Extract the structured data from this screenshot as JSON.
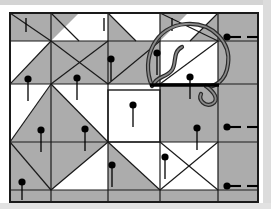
{
  "figure": {
    "kind": "quilting-instruction-diagram",
    "title": "Pieced quilt top with pinned basting and threaded needle",
    "canvas": {
      "width": 271,
      "height": 209
    },
    "background_color": "#ffffff"
  },
  "palette": {
    "patch_light": "#ffffff",
    "patch_gray": "#acacac",
    "seam_line": "#1a1a1a",
    "pin_color": "#000000",
    "thread_outline": "#2b2b2b",
    "thread_fill": "#8a8a8a",
    "needle_color": "#000000",
    "border_color": "#1a1a1a",
    "page_edge": "#c9c9c9"
  },
  "quilt": {
    "frame": {
      "x": 10,
      "y": 13,
      "width": 248,
      "height": 189,
      "stroke_width": 2
    },
    "grid_lines": [
      {
        "name": "vertical-seam-left",
        "x1": 51,
        "y1": 13,
        "x2": 51,
        "y2": 202
      },
      {
        "name": "vertical-seam-center",
        "x1": 108,
        "y1": 13,
        "x2": 108,
        "y2": 202
      },
      {
        "name": "vertical-seam-right-of-center",
        "x1": 160,
        "y1": 13,
        "x2": 160,
        "y2": 202
      },
      {
        "name": "vertical-seam-right",
        "x1": 218,
        "y1": 13,
        "x2": 218,
        "y2": 202
      },
      {
        "name": "horizontal-seam-top",
        "x1": 10,
        "y1": 41,
        "x2": 258,
        "y2": 41
      },
      {
        "name": "horizontal-seam-upper",
        "x1": 10,
        "y1": 84,
        "x2": 258,
        "y2": 84
      },
      {
        "name": "horizontal-seam-lower",
        "x1": 10,
        "y1": 142,
        "x2": 258,
        "y2": 142
      },
      {
        "name": "horizontal-seam-bottom",
        "x1": 10,
        "y1": 190,
        "x2": 258,
        "y2": 190
      }
    ],
    "gray_patches": [
      {
        "name": "top-strip-left-rect",
        "points": "10,13 51,13 51,41 10,41"
      },
      {
        "name": "top-strip-triangle-a",
        "points": "51,41 51,13 79,13"
      },
      {
        "name": "top-strip-triangle-b",
        "points": "108,13 136,41 108,41"
      },
      {
        "name": "top-strip-triangle-c",
        "points": "160,13 188,13 160,41"
      },
      {
        "name": "top-strip-triangle-d",
        "points": "190,41 218,13 218,41"
      },
      {
        "name": "pinwheel-blade-upper-left",
        "points": "51,41 108,41 108,84 51,84"
      },
      {
        "name": "pinwheel-blade-lower-left",
        "points": "10,84 51,41 51,84"
      },
      {
        "name": "pinwheel-sash-diagonal",
        "points": "108,41 160,41 160,84 108,84"
      },
      {
        "name": "right-column-upper",
        "points": "218,13 258,13 258,84 218,84"
      },
      {
        "name": "right-column-lower",
        "points": "218,84 258,84 258,190 218,190"
      },
      {
        "name": "mid-left-diamond",
        "points": "10,142 51,84 108,142 51,190"
      },
      {
        "name": "center-ring-upper-right",
        "points": "160,84 218,84 218,142 160,142"
      },
      {
        "name": "lower-left-wedge",
        "points": "10,190 10,142 51,190"
      },
      {
        "name": "lower-center-wedge",
        "points": "108,142 160,190 108,190"
      },
      {
        "name": "bottom-band-gray",
        "points": "10,190 258,190 258,202 10,202"
      }
    ],
    "diagonal_seams": [
      {
        "name": "diag-top-left-down",
        "x1": 51,
        "y1": 13,
        "x2": 79,
        "y2": 41
      },
      {
        "name": "diag-pinwheel-nw",
        "x1": 10,
        "y1": 13,
        "x2": 51,
        "y2": 41
      },
      {
        "name": "diag-pinwheel-center-a",
        "x1": 51,
        "y1": 41,
        "x2": 108,
        "y2": 84
      },
      {
        "name": "diag-pinwheel-center-b",
        "x1": 108,
        "y1": 41,
        "x2": 51,
        "y2": 84
      },
      {
        "name": "diag-pinwheel-left",
        "x1": 10,
        "y1": 84,
        "x2": 51,
        "y2": 41
      },
      {
        "name": "diag-sash-upper",
        "x1": 108,
        "y1": 84,
        "x2": 160,
        "y2": 41
      },
      {
        "name": "diag-sash-upper-2",
        "x1": 136,
        "y1": 41,
        "x2": 108,
        "y2": 13
      },
      {
        "name": "diag-upper-right-a",
        "x1": 160,
        "y1": 13,
        "x2": 218,
        "y2": 41
      },
      {
        "name": "diag-upper-right-b",
        "x1": 160,
        "y1": 84,
        "x2": 218,
        "y2": 41
      },
      {
        "name": "diag-upper-right-c",
        "x1": 190,
        "y1": 41,
        "x2": 218,
        "y2": 13
      },
      {
        "name": "diag-mid-left-a",
        "x1": 10,
        "y1": 142,
        "x2": 51,
        "y2": 84
      },
      {
        "name": "diag-mid-left-b",
        "x1": 51,
        "y1": 84,
        "x2": 108,
        "y2": 142
      },
      {
        "name": "diag-mid-left-c",
        "x1": 10,
        "y1": 142,
        "x2": 51,
        "y2": 190
      },
      {
        "name": "diag-mid-left-d",
        "x1": 51,
        "y1": 190,
        "x2": 108,
        "y2": 142
      },
      {
        "name": "diag-lower-center",
        "x1": 108,
        "y1": 142,
        "x2": 160,
        "y2": 190
      },
      {
        "name": "diag-lower-right-a",
        "x1": 160,
        "y1": 142,
        "x2": 218,
        "y2": 190
      },
      {
        "name": "diag-lower-right-b",
        "x1": 160,
        "y1": 190,
        "x2": 218,
        "y2": 142
      }
    ],
    "center_square": {
      "x": 108,
      "y": 90,
      "width": 52,
      "height": 52,
      "fill": "#ffffff"
    }
  },
  "pins": {
    "description": "Straight pins inserted vertically, head at top, shaft pointing down",
    "head_radius": 3.6,
    "shaft_length": 22,
    "shaft_width": 1.3,
    "count_vertical": 13,
    "count_horizontal": 3,
    "vertical": [
      {
        "name": "pin-top-strip-1",
        "x": 26,
        "y": 18,
        "shaft": 14,
        "head": 0
      },
      {
        "name": "pin-top-strip-2",
        "x": 104,
        "y": 18,
        "shaft": 13,
        "head": 0
      },
      {
        "name": "pin-top-strip-3",
        "x": 172,
        "y": 18,
        "shaft": 13,
        "head": 0
      },
      {
        "name": "pin-upper-left",
        "x": 28,
        "y": 79,
        "shaft": 22,
        "head": 1
      },
      {
        "name": "pin-upper-mid",
        "x": 77,
        "y": 78,
        "shaft": 22,
        "head": 1
      },
      {
        "name": "pin-upper-right",
        "x": 111,
        "y": 59,
        "shaft": 22,
        "head": 1
      },
      {
        "name": "pin-under-thread",
        "x": 157,
        "y": 53,
        "shaft": 22,
        "head": 1
      },
      {
        "name": "pin-needle-point",
        "x": 190,
        "y": 77,
        "shaft": 22,
        "head": 1
      },
      {
        "name": "pin-center-square",
        "x": 133,
        "y": 105,
        "shaft": 22,
        "head": 1
      },
      {
        "name": "pin-mid-left",
        "x": 41,
        "y": 130,
        "shaft": 22,
        "head": 1
      },
      {
        "name": "pin-mid-center",
        "x": 85,
        "y": 129,
        "shaft": 22,
        "head": 1
      },
      {
        "name": "pin-mid-right",
        "x": 197,
        "y": 128,
        "shaft": 22,
        "head": 1
      },
      {
        "name": "pin-lower-center",
        "x": 112,
        "y": 165,
        "shaft": 22,
        "head": 1
      },
      {
        "name": "pin-lower-right",
        "x": 165,
        "y": 157,
        "shaft": 22,
        "head": 1
      },
      {
        "name": "pin-bottom-left",
        "x": 22,
        "y": 182,
        "shaft": 18,
        "head": 1
      }
    ],
    "horizontal": [
      {
        "name": "pin-edge-top-right",
        "x": 227,
        "y": 37,
        "shaft": 14,
        "dash_gap": 6,
        "dash_len": 11
      },
      {
        "name": "pin-edge-middle-right",
        "x": 227,
        "y": 127,
        "shaft": 14,
        "dash_gap": 6,
        "dash_len": 11
      },
      {
        "name": "pin-edge-bottom-right",
        "x": 227,
        "y": 186,
        "shaft": 14,
        "dash_gap": 6,
        "dash_len": 11
      }
    ]
  },
  "needle_and_thread": {
    "needle": {
      "name": "sewing-needle",
      "x1": 150,
      "y1": 85,
      "x2": 219,
      "y2": 85,
      "thickness": 3.4,
      "eye_end": "right",
      "orientation": "horizontal"
    },
    "thread_loop": {
      "name": "thread-loop",
      "outline_width": 4.2,
      "inner_width": 1.8,
      "loop_description": "large open loop rising above the needle then curling back down to the right with a tail",
      "path_outer": "M 152,86 C 140,58 156,26 186,24 C 214,22 231,44 228,64 C 226,82 213,88 206,86",
      "path_inner_squiggle": "M 182,47 C 172,52 177,63 172,70 C 166,78 157,76 154,84",
      "path_tail": "M 206,86 C 214,92 220,100 212,104 C 205,107 198,100 201,94"
    }
  },
  "page_edges": {
    "top_band": {
      "name": "page-top-edge",
      "x": 0,
      "y": 0,
      "width": 271,
      "height": 5,
      "color": "#d4d4d4"
    },
    "right_band": {
      "name": "page-right-edge",
      "x": 263,
      "y": 0,
      "width": 8,
      "height": 209,
      "color": "#dcdcdc"
    },
    "bottom_band": {
      "name": "page-bottom-edge",
      "x": 0,
      "y": 203,
      "width": 271,
      "height": 6,
      "color": "#e2e2e2"
    }
  },
  "labels": {
    "caption": ""
  }
}
